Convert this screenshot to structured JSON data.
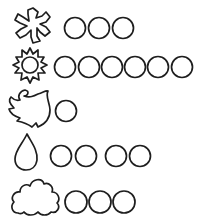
{
  "worksheet": {
    "type": "counting-pictograph",
    "stroke_color": "#1e1e1e",
    "background": "#ffffff",
    "rows": [
      {
        "symbol": "snowflake",
        "count": 3
      },
      {
        "symbol": "sun",
        "count": 6
      },
      {
        "symbol": "wind-leaf",
        "count": 1
      },
      {
        "symbol": "raindrop",
        "count": 4
      },
      {
        "symbol": "cloud",
        "count": 3
      }
    ]
  }
}
